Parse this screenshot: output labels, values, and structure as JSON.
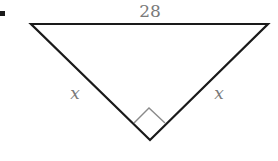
{
  "figure": {
    "type": "right isosceles triangle",
    "bullet": "•",
    "labels": {
      "hypotenuse": "28",
      "left_leg": "x",
      "right_leg": "x"
    },
    "right_angle_marker": true,
    "colors": {
      "line": "#1a1a1a",
      "label": "#7a7a7a",
      "marker": "#8a8a8a"
    }
  }
}
